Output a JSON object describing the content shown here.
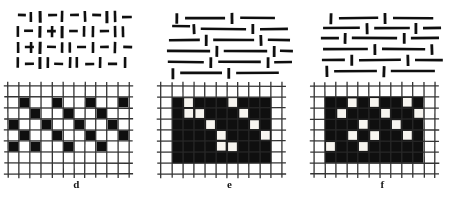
{
  "figure": {
    "background_color": "#ffffff",
    "ink_color": "#111111",
    "panel_count": 3
  },
  "panels": [
    {
      "id": "d",
      "caption": "d",
      "texture": {
        "name": "mixed-orientation-short-segments",
        "description": "Short line segments of mixed vertical and horizontal orientation arranged in a loose lattice",
        "segment_color": "#111111",
        "segments": [
          {
            "x1": 9,
            "y1": 11,
            "x2": 17,
            "y2": 11,
            "w": 2.6
          },
          {
            "x1": 22,
            "y1": 8,
            "x2": 22,
            "y2": 18,
            "w": 2.6
          },
          {
            "x1": 31,
            "y1": 7,
            "x2": 31,
            "y2": 19,
            "w": 3.0
          },
          {
            "x1": 39,
            "y1": 11,
            "x2": 48,
            "y2": 11,
            "w": 2.6
          },
          {
            "x1": 53,
            "y1": 7,
            "x2": 53,
            "y2": 18,
            "w": 2.6
          },
          {
            "x1": 61,
            "y1": 11,
            "x2": 70,
            "y2": 11,
            "w": 2.6
          },
          {
            "x1": 76,
            "y1": 7,
            "x2": 76,
            "y2": 18,
            "w": 2.6
          },
          {
            "x1": 83,
            "y1": 11,
            "x2": 92,
            "y2": 11,
            "w": 2.6
          },
          {
            "x1": 98,
            "y1": 7,
            "x2": 98,
            "y2": 19,
            "w": 3.0
          },
          {
            "x1": 106,
            "y1": 7,
            "x2": 106,
            "y2": 18,
            "w": 2.6
          },
          {
            "x1": 113,
            "y1": 13,
            "x2": 123,
            "y2": 13,
            "w": 2.6
          },
          {
            "x1": 9,
            "y1": 22,
            "x2": 9,
            "y2": 33,
            "w": 2.6
          },
          {
            "x1": 15,
            "y1": 27,
            "x2": 24,
            "y2": 27,
            "w": 2.6
          },
          {
            "x1": 31,
            "y1": 22,
            "x2": 31,
            "y2": 34,
            "w": 3.0
          },
          {
            "x1": 38,
            "y1": 27,
            "x2": 47,
            "y2": 27,
            "w": 2.6
          },
          {
            "x1": 43,
            "y1": 22,
            "x2": 43,
            "y2": 33,
            "w": 2.6
          },
          {
            "x1": 53,
            "y1": 22,
            "x2": 53,
            "y2": 34,
            "w": 3.0
          },
          {
            "x1": 60,
            "y1": 27,
            "x2": 69,
            "y2": 27,
            "w": 2.6
          },
          {
            "x1": 75,
            "y1": 22,
            "x2": 75,
            "y2": 33,
            "w": 2.6
          },
          {
            "x1": 84,
            "y1": 22,
            "x2": 84,
            "y2": 33,
            "w": 2.6
          },
          {
            "x1": 91,
            "y1": 27,
            "x2": 100,
            "y2": 27,
            "w": 2.6
          },
          {
            "x1": 106,
            "y1": 22,
            "x2": 106,
            "y2": 33,
            "w": 2.6
          },
          {
            "x1": 114,
            "y1": 22,
            "x2": 114,
            "y2": 33,
            "w": 2.6
          },
          {
            "x1": 9,
            "y1": 38,
            "x2": 9,
            "y2": 49,
            "w": 2.6
          },
          {
            "x1": 16,
            "y1": 43,
            "x2": 25,
            "y2": 43,
            "w": 2.6
          },
          {
            "x1": 22,
            "y1": 38,
            "x2": 22,
            "y2": 49,
            "w": 2.6
          },
          {
            "x1": 31,
            "y1": 38,
            "x2": 31,
            "y2": 50,
            "w": 3.0
          },
          {
            "x1": 38,
            "y1": 43,
            "x2": 47,
            "y2": 43,
            "w": 2.6
          },
          {
            "x1": 53,
            "y1": 38,
            "x2": 53,
            "y2": 49,
            "w": 2.6
          },
          {
            "x1": 61,
            "y1": 38,
            "x2": 61,
            "y2": 49,
            "w": 2.6
          },
          {
            "x1": 68,
            "y1": 43,
            "x2": 77,
            "y2": 43,
            "w": 2.6
          },
          {
            "x1": 84,
            "y1": 38,
            "x2": 84,
            "y2": 49,
            "w": 2.6
          },
          {
            "x1": 91,
            "y1": 43,
            "x2": 100,
            "y2": 43,
            "w": 2.6
          },
          {
            "x1": 106,
            "y1": 38,
            "x2": 106,
            "y2": 49,
            "w": 2.6
          },
          {
            "x1": 114,
            "y1": 43,
            "x2": 123,
            "y2": 43,
            "w": 2.6
          },
          {
            "x1": 9,
            "y1": 53,
            "x2": 9,
            "y2": 64,
            "w": 2.6
          },
          {
            "x1": 16,
            "y1": 60,
            "x2": 25,
            "y2": 60,
            "w": 2.6
          },
          {
            "x1": 31,
            "y1": 53,
            "x2": 31,
            "y2": 65,
            "w": 3.0
          },
          {
            "x1": 39,
            "y1": 53,
            "x2": 39,
            "y2": 64,
            "w": 2.6
          },
          {
            "x1": 45,
            "y1": 60,
            "x2": 54,
            "y2": 60,
            "w": 2.6
          },
          {
            "x1": 61,
            "y1": 53,
            "x2": 61,
            "y2": 64,
            "w": 2.6
          },
          {
            "x1": 68,
            "y1": 53,
            "x2": 68,
            "y2": 64,
            "w": 2.6
          },
          {
            "x1": 76,
            "y1": 60,
            "x2": 85,
            "y2": 60,
            "w": 2.6
          },
          {
            "x1": 91,
            "y1": 53,
            "x2": 91,
            "y2": 64,
            "w": 2.6
          },
          {
            "x1": 99,
            "y1": 60,
            "x2": 108,
            "y2": 60,
            "w": 2.6
          },
          {
            "x1": 116,
            "y1": 53,
            "x2": 116,
            "y2": 64,
            "w": 2.6
          }
        ]
      },
      "grid": {
        "name": "checkerboard-grid",
        "rows": 8,
        "cols": 11,
        "cell_size": 11.0,
        "origin_x": 8,
        "origin_y": 6,
        "line_color": "#2b2b2b",
        "line_width": 1.3,
        "fill_color": "#111111",
        "fill_cells": [
          [
            1,
            1
          ],
          [
            1,
            4
          ],
          [
            1,
            7
          ],
          [
            1,
            10
          ],
          [
            2,
            2
          ],
          [
            2,
            5
          ],
          [
            2,
            8
          ],
          [
            3,
            0
          ],
          [
            3,
            3
          ],
          [
            3,
            6
          ],
          [
            3,
            9
          ],
          [
            4,
            1
          ],
          [
            4,
            4
          ],
          [
            4,
            7
          ],
          [
            4,
            10
          ],
          [
            5,
            0
          ],
          [
            5,
            2
          ],
          [
            5,
            5
          ],
          [
            5,
            8
          ]
        ]
      }
    },
    {
      "id": "e",
      "caption": "e",
      "texture": {
        "name": "long-horizontal-lines-texture",
        "description": "Long horizontal line segments interleaved with short vertical tick marks",
        "segment_color": "#111111",
        "segments": [
          {
            "x1": 15,
            "y1": 9,
            "x2": 15,
            "y2": 20,
            "w": 2.8
          },
          {
            "x1": 23,
            "y1": 14,
            "x2": 63,
            "y2": 14,
            "w": 2.6
          },
          {
            "x1": 70,
            "y1": 9,
            "x2": 70,
            "y2": 20,
            "w": 2.8
          },
          {
            "x1": 78,
            "y1": 14,
            "x2": 113,
            "y2": 14,
            "w": 2.6
          },
          {
            "x1": 10,
            "y1": 22,
            "x2": 28,
            "y2": 22,
            "w": 2.6
          },
          {
            "x1": 32,
            "y1": 20,
            "x2": 32,
            "y2": 30,
            "w": 2.8
          },
          {
            "x1": 39,
            "y1": 25,
            "x2": 84,
            "y2": 25,
            "w": 2.6
          },
          {
            "x1": 91,
            "y1": 20,
            "x2": 91,
            "y2": 30,
            "w": 2.8
          },
          {
            "x1": 98,
            "y1": 25,
            "x2": 126,
            "y2": 25,
            "w": 2.6
          },
          {
            "x1": 7,
            "y1": 36,
            "x2": 38,
            "y2": 36,
            "w": 2.6
          },
          {
            "x1": 44,
            "y1": 31,
            "x2": 44,
            "y2": 42,
            "w": 2.8
          },
          {
            "x1": 51,
            "y1": 36,
            "x2": 92,
            "y2": 36,
            "w": 2.6
          },
          {
            "x1": 99,
            "y1": 31,
            "x2": 99,
            "y2": 42,
            "w": 2.8
          },
          {
            "x1": 106,
            "y1": 36,
            "x2": 128,
            "y2": 36,
            "w": 2.6
          },
          {
            "x1": 5,
            "y1": 47,
            "x2": 48,
            "y2": 47,
            "w": 2.6
          },
          {
            "x1": 55,
            "y1": 42,
            "x2": 55,
            "y2": 53,
            "w": 2.8
          },
          {
            "x1": 62,
            "y1": 47,
            "x2": 105,
            "y2": 47,
            "w": 2.6
          },
          {
            "x1": 112,
            "y1": 42,
            "x2": 112,
            "y2": 53,
            "w": 2.8
          },
          {
            "x1": 118,
            "y1": 47,
            "x2": 131,
            "y2": 47,
            "w": 2.6
          },
          {
            "x1": 6,
            "y1": 58,
            "x2": 42,
            "y2": 58,
            "w": 2.6
          },
          {
            "x1": 49,
            "y1": 53,
            "x2": 49,
            "y2": 64,
            "w": 2.8
          },
          {
            "x1": 56,
            "y1": 58,
            "x2": 99,
            "y2": 58,
            "w": 2.6
          },
          {
            "x1": 106,
            "y1": 53,
            "x2": 106,
            "y2": 64,
            "w": 2.8
          },
          {
            "x1": 112,
            "y1": 58,
            "x2": 130,
            "y2": 58,
            "w": 2.6
          },
          {
            "x1": 11,
            "y1": 64,
            "x2": 11,
            "y2": 75,
            "w": 2.8
          },
          {
            "x1": 18,
            "y1": 69,
            "x2": 60,
            "y2": 69,
            "w": 2.6
          },
          {
            "x1": 67,
            "y1": 64,
            "x2": 67,
            "y2": 75,
            "w": 2.8
          },
          {
            "x1": 74,
            "y1": 69,
            "x2": 117,
            "y2": 69,
            "w": 2.6
          }
        ]
      },
      "grid": {
        "name": "diagonal-chain-grid",
        "rows": 8,
        "cols": 11,
        "cell_size": 11.0,
        "origin_x": 8,
        "origin_y": 6,
        "line_color": "#2b2b2b",
        "line_width": 1.3,
        "fill_color": "#111111",
        "hole_color": "#f5f3ee",
        "black_region": {
          "col_start": 1,
          "col_end": 9,
          "row_start": 1,
          "row_end": 6
        },
        "white_cells": [
          [
            1,
            1
          ],
          [
            2,
            2
          ],
          [
            3,
            3
          ],
          [
            4,
            4
          ],
          [
            5,
            5
          ],
          [
            1,
            5
          ],
          [
            2,
            6
          ],
          [
            3,
            7
          ],
          [
            4,
            8
          ],
          [
            5,
            4
          ],
          [
            2,
            1
          ]
        ]
      }
    },
    {
      "id": "f",
      "caption": "f",
      "texture": {
        "name": "mixed-length-horizontal-texture",
        "description": "Horizontal line segments of varied lengths broken by short vertical tick marks",
        "segment_color": "#111111",
        "segments": [
          {
            "x1": 16,
            "y1": 9,
            "x2": 16,
            "y2": 20,
            "w": 2.8
          },
          {
            "x1": 24,
            "y1": 14,
            "x2": 63,
            "y2": 14,
            "w": 2.6
          },
          {
            "x1": 70,
            "y1": 9,
            "x2": 70,
            "y2": 20,
            "w": 2.8
          },
          {
            "x1": 78,
            "y1": 14,
            "x2": 118,
            "y2": 14,
            "w": 2.6
          },
          {
            "x1": 8,
            "y1": 24,
            "x2": 45,
            "y2": 24,
            "w": 2.6
          },
          {
            "x1": 52,
            "y1": 19,
            "x2": 52,
            "y2": 30,
            "w": 2.8
          },
          {
            "x1": 59,
            "y1": 24,
            "x2": 95,
            "y2": 24,
            "w": 2.6
          },
          {
            "x1": 101,
            "y1": 19,
            "x2": 101,
            "y2": 30,
            "w": 2.8
          },
          {
            "x1": 108,
            "y1": 24,
            "x2": 126,
            "y2": 24,
            "w": 2.6
          },
          {
            "x1": 6,
            "y1": 34,
            "x2": 24,
            "y2": 34,
            "w": 2.6
          },
          {
            "x1": 30,
            "y1": 29,
            "x2": 30,
            "y2": 40,
            "w": 2.8
          },
          {
            "x1": 37,
            "y1": 34,
            "x2": 82,
            "y2": 34,
            "w": 2.6
          },
          {
            "x1": 89,
            "y1": 29,
            "x2": 89,
            "y2": 40,
            "w": 2.8
          },
          {
            "x1": 96,
            "y1": 34,
            "x2": 124,
            "y2": 34,
            "w": 2.6
          },
          {
            "x1": 8,
            "y1": 45,
            "x2": 53,
            "y2": 45,
            "w": 2.6
          },
          {
            "x1": 60,
            "y1": 40,
            "x2": 60,
            "y2": 51,
            "w": 2.8
          },
          {
            "x1": 67,
            "y1": 45,
            "x2": 110,
            "y2": 45,
            "w": 2.6
          },
          {
            "x1": 117,
            "y1": 40,
            "x2": 117,
            "y2": 51,
            "w": 2.8
          },
          {
            "x1": 7,
            "y1": 56,
            "x2": 30,
            "y2": 56,
            "w": 2.6
          },
          {
            "x1": 37,
            "y1": 51,
            "x2": 37,
            "y2": 62,
            "w": 2.8
          },
          {
            "x1": 44,
            "y1": 56,
            "x2": 86,
            "y2": 56,
            "w": 2.6
          },
          {
            "x1": 93,
            "y1": 51,
            "x2": 93,
            "y2": 62,
            "w": 2.8
          },
          {
            "x1": 100,
            "y1": 56,
            "x2": 128,
            "y2": 56,
            "w": 2.6
          },
          {
            "x1": 12,
            "y1": 62,
            "x2": 12,
            "y2": 73,
            "w": 2.8
          },
          {
            "x1": 19,
            "y1": 67,
            "x2": 62,
            "y2": 67,
            "w": 2.6
          },
          {
            "x1": 69,
            "y1": 62,
            "x2": 69,
            "y2": 73,
            "w": 2.8
          },
          {
            "x1": 76,
            "y1": 67,
            "x2": 120,
            "y2": 67,
            "w": 2.6
          }
        ]
      },
      "grid": {
        "name": "scattered-holes-grid",
        "rows": 8,
        "cols": 11,
        "cell_size": 11.0,
        "origin_x": 8,
        "origin_y": 6,
        "line_color": "#2b2b2b",
        "line_width": 1.3,
        "fill_color": "#111111",
        "hole_color": "#f5f3ee",
        "black_region": {
          "col_start": 1,
          "col_end": 9,
          "row_start": 1,
          "row_end": 6
        },
        "white_cells": [
          [
            1,
            2
          ],
          [
            1,
            4
          ],
          [
            1,
            7
          ],
          [
            2,
            1
          ],
          [
            2,
            5
          ],
          [
            2,
            8
          ],
          [
            3,
            3
          ],
          [
            3,
            6
          ],
          [
            4,
            2
          ],
          [
            4,
            4
          ],
          [
            4,
            7
          ],
          [
            5,
            0
          ],
          [
            5,
            3
          ]
        ]
      }
    }
  ],
  "bottom_text": {
    "name": "cut-off-caption-fragment",
    "value": "",
    "note_visible": false
  }
}
